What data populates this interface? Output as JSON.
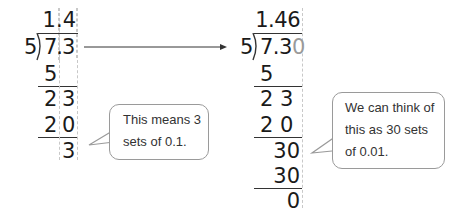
{
  "left_division": {
    "quotient": "1.4",
    "divisor": "5",
    "dividend": "7.3",
    "steps": [
      "5",
      "2 3",
      "2 0",
      "3"
    ]
  },
  "right_division": {
    "quotient": "1.46",
    "divisor": "5",
    "dividend": "7.3",
    "dividend_appended_zero": "0",
    "steps": [
      "5",
      "2 3",
      "2 0",
      "30",
      "30",
      "0"
    ]
  },
  "arrow": {
    "direction": "right"
  },
  "callouts": [
    {
      "line1": "This means 3",
      "line2": "sets of 0.1."
    },
    {
      "line1": "We can think of",
      "line2": "this as 30 sets",
      "line3": "of 0.01."
    }
  ],
  "colors": {
    "text": "#1a1a1a",
    "appended_zero": "#9a9a9a",
    "guides": "#c8c8c8",
    "bubble_border": "#9a9a9a"
  }
}
